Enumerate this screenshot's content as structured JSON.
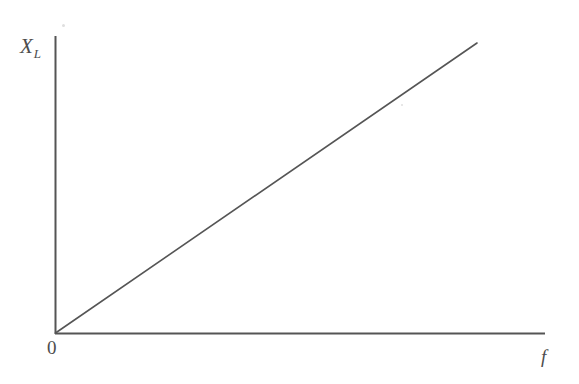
{
  "figure": {
    "background_color": "#ffffff",
    "line_color": "#555555"
  },
  "labels": {
    "y_axis_symbol": "X",
    "y_axis_subscript": "L",
    "x_axis_symbol": "f",
    "origin": "0"
  },
  "chart_data": {
    "type": "line",
    "title": "",
    "xlabel": "f",
    "ylabel": "X_L",
    "grid": false,
    "legend": null,
    "axes": {
      "x_origin_px": 55,
      "y_origin_px": 333,
      "x_axis_end_px": 545,
      "y_axis_top_px": 36,
      "x_tick_labels": [
        "0"
      ],
      "y_tick_labels": []
    },
    "series": [
      {
        "name": "X_L = 2*pi*f*L",
        "x": [
          0,
          1
        ],
        "y": [
          0,
          1
        ],
        "points_px": [
          [
            55,
            333
          ],
          [
            477,
            43
          ]
        ],
        "color": "#555555",
        "width_px": 1.6,
        "style": "solid"
      }
    ],
    "xlim": [
      0,
      1
    ],
    "ylim": [
      0,
      1
    ],
    "annotations": []
  }
}
